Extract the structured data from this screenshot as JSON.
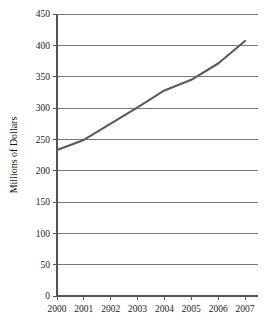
{
  "chart_data": {
    "type": "line",
    "title": "",
    "subtitle": "",
    "xlabel": "",
    "ylabel": "Millions of Dollars",
    "categories": [
      "2000",
      "2001",
      "2002",
      "2003",
      "2004",
      "2005",
      "2006",
      "2007"
    ],
    "x": [
      2000,
      2001,
      2002,
      2003,
      2004,
      2005,
      2006,
      2007
    ],
    "values": [
      233,
      249,
      275,
      301,
      328,
      345,
      371,
      407
    ],
    "series": [
      {
        "name": "Millions of Dollars",
        "values": [
          233,
          249,
          275,
          301,
          328,
          345,
          371,
          407
        ],
        "color": "#5a5a5a"
      }
    ],
    "ylim": [
      0,
      450
    ],
    "ytick_labels": [
      "0",
      "50",
      "100",
      "150",
      "200",
      "250",
      "300",
      "350",
      "400",
      "450"
    ],
    "yticks": [
      0,
      50,
      100,
      150,
      200,
      250,
      300,
      350,
      400,
      450
    ],
    "xtick_labels": [
      "2000",
      "2001",
      "2002",
      "2003",
      "2004",
      "2005",
      "2006",
      "2007"
    ],
    "grid": "horizontal",
    "legend": "none",
    "annotations": []
  },
  "colors": {
    "line": "#5a5a5a",
    "gridline": "#777777",
    "axis": "#555555",
    "text": "#222222",
    "background": "#ffffff"
  },
  "axis": {
    "y_title": "Millions of Dollars"
  }
}
